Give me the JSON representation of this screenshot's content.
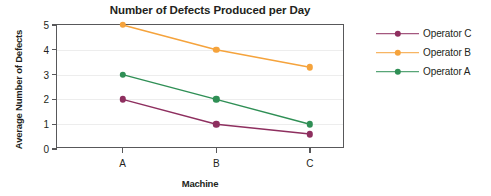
{
  "chart_data": {
    "type": "line",
    "title": "Number of Defects Produced per Day",
    "xlabel": "Machine",
    "ylabel": "Average Number of Defects",
    "categories": [
      "A",
      "B",
      "C"
    ],
    "ylim": [
      0,
      5
    ],
    "yticks": [
      0,
      1,
      2,
      3,
      4,
      5
    ],
    "ytick_labels": [
      "0",
      "1",
      "2",
      "3",
      "4",
      "5"
    ],
    "grid": true,
    "legend_position": "right",
    "series": [
      {
        "name": "Operator C",
        "values": [
          2,
          1,
          0.6
        ],
        "color": "#8e2f5f"
      },
      {
        "name": "Operator B",
        "values": [
          5,
          4,
          3.3
        ],
        "color": "#f5a33c"
      },
      {
        "name": "Operator A",
        "values": [
          3,
          2,
          1.0
        ],
        "color": "#2f8f55"
      }
    ],
    "colors": {
      "operator_c": "#8e2f5f",
      "operator_b": "#f5a33c",
      "operator_a": "#2f8f55",
      "axis": "#58585a",
      "grid": "#ededed",
      "text": "#231f20",
      "background": "#ffffff"
    }
  },
  "legend": {
    "items": [
      {
        "label": "Operator C"
      },
      {
        "label": "Operator B"
      },
      {
        "label": "Operator A"
      }
    ]
  }
}
